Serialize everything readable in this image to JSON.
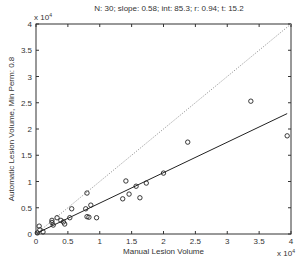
{
  "chart_data": {
    "type": "scatter",
    "title": "N: 30; slope: 0.58; int: 85.3; r: 0.94; t: 15.2",
    "xlabel": "Manual Lesion Volume",
    "ylabel": "Automatic Lesion Volume, Min Perm: 0.8",
    "x_multiplier_label": "x 10^4",
    "y_multiplier_label": "x 10^4",
    "xlim": [
      0,
      4
    ],
    "ylim": [
      0,
      4
    ],
    "xticks": [
      "0",
      "0.5",
      "1",
      "1.5",
      "2",
      "2.5",
      "3",
      "3.5",
      "4"
    ],
    "yticks": [
      "0",
      "0.5",
      "1",
      "1.5",
      "2",
      "2.5",
      "3",
      "3.5",
      "4"
    ],
    "grid": false,
    "legend": null,
    "units_scale": 10000,
    "points": [
      {
        "x": 0.02,
        "y": 0.02
      },
      {
        "x": 0.05,
        "y": 0.15
      },
      {
        "x": 0.06,
        "y": 0.08
      },
      {
        "x": 0.11,
        "y": 0.04
      },
      {
        "x": 0.25,
        "y": 0.26
      },
      {
        "x": 0.25,
        "y": 0.22
      },
      {
        "x": 0.27,
        "y": 0.17
      },
      {
        "x": 0.33,
        "y": 0.31
      },
      {
        "x": 0.39,
        "y": 0.26
      },
      {
        "x": 0.43,
        "y": 0.23
      },
      {
        "x": 0.45,
        "y": 0.19
      },
      {
        "x": 0.53,
        "y": 0.31
      },
      {
        "x": 0.56,
        "y": 0.48
      },
      {
        "x": 0.78,
        "y": 0.48
      },
      {
        "x": 0.8,
        "y": 0.78
      },
      {
        "x": 0.8,
        "y": 0.33
      },
      {
        "x": 0.83,
        "y": 0.32
      },
      {
        "x": 0.86,
        "y": 0.55
      },
      {
        "x": 0.95,
        "y": 0.31
      },
      {
        "x": 1.36,
        "y": 0.67
      },
      {
        "x": 1.41,
        "y": 1.01
      },
      {
        "x": 1.46,
        "y": 0.76
      },
      {
        "x": 1.57,
        "y": 0.91
      },
      {
        "x": 1.63,
        "y": 0.69
      },
      {
        "x": 1.73,
        "y": 0.97
      },
      {
        "x": 2.0,
        "y": 1.16
      },
      {
        "x": 2.38,
        "y": 1.75
      },
      {
        "x": 3.37,
        "y": 2.53
      },
      {
        "x": 3.94,
        "y": 1.87
      }
    ],
    "lines": [
      {
        "name": "regression fit",
        "style": "solid",
        "slope": 0.58,
        "intercept": 0.00853,
        "x_range": [
          0,
          3.94
        ]
      },
      {
        "name": "identity",
        "style": "dotted",
        "slope": 1.0,
        "intercept": 0,
        "x_range": [
          0,
          4
        ]
      }
    ]
  }
}
